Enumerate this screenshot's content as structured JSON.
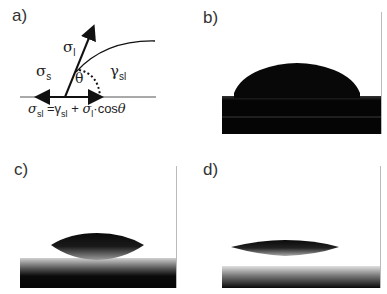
{
  "panels": [
    {
      "id": "a",
      "label": "a)",
      "type": "schematic",
      "symbols": {
        "sigma_l": {
          "base": "σ",
          "sub": "l"
        },
        "sigma_s": {
          "base": "σ",
          "sub": "s"
        },
        "gamma_sl": {
          "base": "γ",
          "sub": "sl"
        },
        "theta": "θ"
      },
      "equation": {
        "lhs_base": "σ",
        "lhs_sub": "sl",
        "eq": "=",
        "t1_base": "γ",
        "t1_sub": "sl",
        "plus": " + ",
        "t2_base": "σ",
        "t2_sub": "l",
        "t2_rest": "·cos",
        "theta": "θ"
      }
    },
    {
      "id": "b",
      "label": "b)",
      "type": "droplet-photo",
      "contact": "high contact angle"
    },
    {
      "id": "c",
      "label": "c)",
      "type": "droplet-photo",
      "contact": "medium contact angle"
    },
    {
      "id": "d",
      "label": "d)",
      "type": "droplet-photo",
      "contact": "low contact angle"
    }
  ],
  "colors": {
    "drop": "#0a0a0a",
    "substrate": "#050505",
    "background": "#ffffff",
    "border": "#bbbbbb"
  }
}
